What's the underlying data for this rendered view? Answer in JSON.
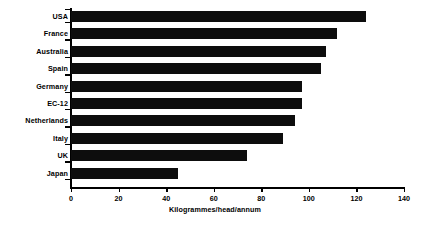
{
  "chart_data": {
    "type": "bar",
    "orientation": "horizontal",
    "title": "",
    "xlabel": "Kilogrammes/head/annum",
    "ylabel": "",
    "categories": [
      "USA",
      "France",
      "Australia",
      "Spain",
      "Germany",
      "EC-12",
      "Netherlands",
      "Italy",
      "UK",
      "Japan"
    ],
    "values": [
      124,
      112,
      107,
      105,
      97,
      97,
      94,
      89,
      74,
      45
    ],
    "xlim": [
      0,
      140
    ],
    "xticks": [
      0,
      20,
      40,
      60,
      80,
      100,
      120,
      140
    ],
    "xtick_labels": [
      "0",
      "20",
      "40",
      "60",
      "80",
      "100",
      "120",
      "140"
    ],
    "grid": false,
    "legend": null,
    "bar_color": "#0d0d0d",
    "axis_color": "#000000",
    "background": "#ffffff"
  }
}
